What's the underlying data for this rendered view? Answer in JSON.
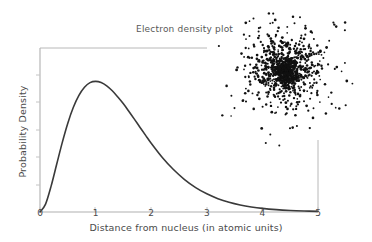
{
  "figure": {
    "title": "Electron density plot",
    "width": 372,
    "height": 242,
    "background": "#ffffff"
  },
  "axes": {
    "xlabel": "Distance from nucleus (in atomic units)",
    "ylabel": "Probability Density",
    "x_tick_labels": [
      "0",
      "1",
      "2",
      "3",
      "4",
      "5"
    ],
    "y_tick_labels": [],
    "axis_color": "#b0b0b0",
    "text_color": "#4a4a4a"
  },
  "chart_data": {
    "type": "line",
    "title": "Electron density plot",
    "xlabel": "Distance from nucleus (in atomic units)",
    "ylabel": "Probability Density",
    "xlim": [
      0,
      5
    ],
    "ylim": [
      0,
      0.58
    ],
    "xticks": [
      0,
      1,
      2,
      3,
      4,
      5
    ],
    "yticks": [],
    "grid": false,
    "legend": null,
    "line_color": "#3a3a3a",
    "line_width": 1.6,
    "series": [
      {
        "name": "Radial probability density",
        "formula": "4 * r^2 * exp(-2r)",
        "x": [
          0.0,
          0.1,
          0.2,
          0.3,
          0.4,
          0.5,
          0.6,
          0.7,
          0.8,
          0.9,
          1.0,
          1.1,
          1.2,
          1.3,
          1.4,
          1.5,
          1.6,
          1.7,
          1.8,
          1.9,
          2.0,
          2.2,
          2.4,
          2.6,
          2.8,
          3.0,
          3.2,
          3.4,
          3.6,
          3.8,
          4.0,
          4.25,
          4.5,
          4.75,
          5.0
        ],
        "y": [
          0.0,
          0.0328,
          0.1073,
          0.1976,
          0.2875,
          0.3679,
          0.4337,
          0.4831,
          0.5167,
          0.5361,
          0.5413,
          0.5364,
          0.5228,
          0.5021,
          0.4761,
          0.4481,
          0.4164,
          0.3836,
          0.3504,
          0.3174,
          0.2851,
          0.2261,
          0.1759,
          0.1344,
          0.1012,
          0.0753,
          0.0554,
          0.0404,
          0.0292,
          0.0209,
          0.0149,
          0.0098,
          0.0064,
          0.0041,
          0.0026
        ]
      }
    ]
  },
  "scatter_inset": {
    "name": "electron-density-cloud",
    "type": "scatter",
    "point_count": 1100,
    "point_color": "#111111",
    "point_size_px": 2.2,
    "center_x_px": 286,
    "center_y_px": 70,
    "spread_px": 26,
    "bounds_px": {
      "left": 212,
      "top": 4,
      "right": 356,
      "bottom": 146
    },
    "description": "Dense random dot cloud representing the probability cloud of the electron around the nucleus."
  },
  "annotations": {
    "frame_top_line": {
      "x1": 40,
      "y1": 48,
      "x2": 207,
      "y2": 48,
      "color": "#b8b8b8"
    },
    "frame_right_line": {
      "x1": 318,
      "y1": 140,
      "x2": 318,
      "y2": 212,
      "color": "#b8b8b8"
    }
  }
}
